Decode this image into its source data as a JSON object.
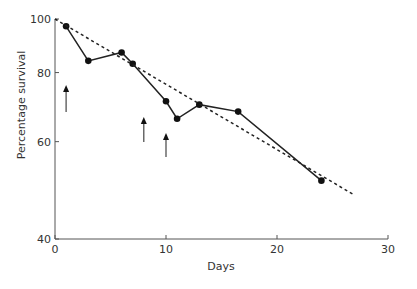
{
  "chart_data": {
    "type": "line",
    "title": "",
    "xlabel": "Days",
    "ylabel": "Percentage survival",
    "xlim": [
      0,
      30
    ],
    "ylim": [
      40,
      100
    ],
    "yscale": "log",
    "x_ticks": [
      0,
      10,
      20,
      30
    ],
    "y_ticks": [
      40,
      60,
      80,
      100
    ],
    "grid": false,
    "legend": null,
    "series": [
      {
        "name": "observed survival",
        "style": "solid-with-markers",
        "x": [
          1,
          3,
          6,
          7,
          10,
          11,
          13,
          16.5,
          24
        ],
        "y": [
          97,
          84,
          87,
          83,
          71,
          66,
          70,
          68,
          51
        ]
      },
      {
        "name": "fitted trend",
        "style": "dashed",
        "x": [
          0,
          27
        ],
        "y": [
          100,
          48
        ]
      }
    ],
    "annotations": [
      {
        "type": "arrow-up",
        "x_day": 1,
        "label": ""
      },
      {
        "type": "arrow-up",
        "x_day": 8,
        "label": ""
      },
      {
        "type": "arrow-up",
        "x_day": 10,
        "label": ""
      }
    ]
  },
  "axes": {
    "x_title": "Days",
    "y_title": "Percentage survival",
    "x_tick_labels": [
      "0",
      "10",
      "20",
      "30"
    ],
    "y_tick_labels": [
      "40",
      "60",
      "80",
      "100"
    ]
  },
  "colors": {
    "axis": "#555555",
    "line": "#222222",
    "marker": "#111111",
    "arrow": "#444444"
  }
}
